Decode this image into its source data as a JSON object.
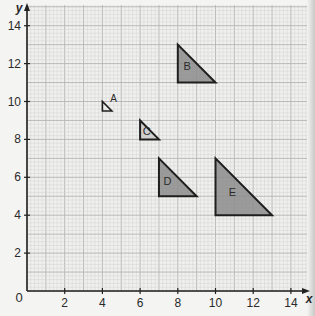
{
  "axes": {
    "x_label": "x",
    "y_label": "y",
    "origin_label": "0",
    "x_ticks": [
      2,
      4,
      6,
      8,
      10,
      12,
      14
    ],
    "y_ticks": [
      2,
      4,
      6,
      8,
      10,
      12,
      14
    ],
    "x_range": [
      0,
      14.8
    ],
    "y_range": [
      0,
      15
    ]
  },
  "grid": {
    "minor_step": 0.2,
    "major_step": 1,
    "background": "#f0f0ee",
    "minor_color": "#d2d2d2",
    "major_color": "#b4b4b4"
  },
  "colors": {
    "axis": "#222222",
    "outline": "#1e1e1e",
    "fill": "#8c8c8c",
    "fill_light": "#cfcfcf",
    "text": "#2a2a2a"
  },
  "shapes": [
    {
      "label": "A",
      "right_angle": [
        4,
        9.5
      ],
      "leg": 0.5,
      "fill": "none",
      "label_pos": [
        4.6,
        9.95
      ],
      "label_outside": true
    },
    {
      "label": "B",
      "right_angle": [
        8,
        11
      ],
      "leg": 2,
      "fill": "dark",
      "label_pos": [
        8.5,
        11.65
      ]
    },
    {
      "label": "C",
      "right_angle": [
        6,
        8
      ],
      "leg": 1,
      "fill": "light",
      "label_pos": [
        6.35,
        8.25
      ]
    },
    {
      "label": "D",
      "right_angle": [
        7,
        5
      ],
      "leg": 2,
      "fill": "dark",
      "label_pos": [
        7.45,
        5.6
      ]
    },
    {
      "label": "E",
      "right_angle": [
        10,
        4
      ],
      "leg": 3,
      "fill": "dark",
      "label_pos": [
        10.9,
        5.0
      ]
    }
  ],
  "chart_data": {
    "type": "scatter",
    "title": "",
    "xlabel": "x",
    "ylabel": "y",
    "xlim": [
      0,
      14.8
    ],
    "ylim": [
      0,
      15
    ],
    "grid": true,
    "x_ticks": [
      0,
      2,
      4,
      6,
      8,
      10,
      12,
      14
    ],
    "y_ticks": [
      0,
      2,
      4,
      6,
      8,
      10,
      12,
      14
    ],
    "series": [
      {
        "name": "A",
        "vertices": [
          [
            4,
            10
          ],
          [
            4,
            9.5
          ],
          [
            4.5,
            9.5
          ]
        ]
      },
      {
        "name": "B",
        "vertices": [
          [
            8,
            13
          ],
          [
            8,
            11
          ],
          [
            10,
            11
          ]
        ]
      },
      {
        "name": "C",
        "vertices": [
          [
            6,
            9
          ],
          [
            6,
            8
          ],
          [
            7,
            8
          ]
        ]
      },
      {
        "name": "D",
        "vertices": [
          [
            7,
            7
          ],
          [
            7,
            5
          ],
          [
            9,
            5
          ]
        ]
      },
      {
        "name": "E",
        "vertices": [
          [
            10,
            7
          ],
          [
            10,
            4
          ],
          [
            13,
            4
          ]
        ]
      }
    ]
  }
}
